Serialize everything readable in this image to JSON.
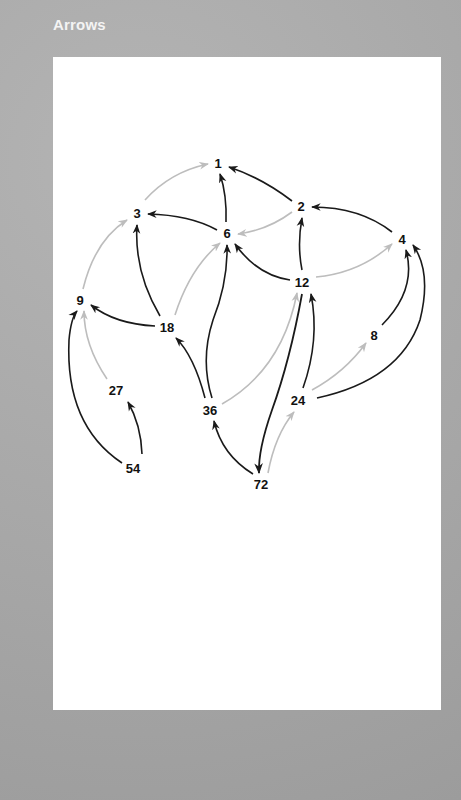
{
  "title": "Arrows",
  "colors": {
    "background": "#a8a8a8",
    "panel": "#ffffff",
    "edge_dark": "#1a1a1a",
    "edge_light": "#bdbdbd",
    "label": "#111111"
  },
  "nodes": [
    {
      "id": "1",
      "label": "1",
      "x": 218,
      "y": 163
    },
    {
      "id": "2",
      "label": "2",
      "x": 301,
      "y": 206
    },
    {
      "id": "3",
      "label": "3",
      "x": 137,
      "y": 213
    },
    {
      "id": "4",
      "label": "4",
      "x": 402,
      "y": 239
    },
    {
      "id": "6",
      "label": "6",
      "x": 227,
      "y": 233
    },
    {
      "id": "9",
      "label": "9",
      "x": 80,
      "y": 300
    },
    {
      "id": "12",
      "label": "12",
      "x": 302,
      "y": 282
    },
    {
      "id": "18",
      "label": "18",
      "x": 167,
      "y": 327
    },
    {
      "id": "8",
      "label": "8",
      "x": 374,
      "y": 335
    },
    {
      "id": "27",
      "label": "27",
      "x": 116,
      "y": 390
    },
    {
      "id": "24",
      "label": "24",
      "x": 298,
      "y": 400
    },
    {
      "id": "36",
      "label": "36",
      "x": 210,
      "y": 410
    },
    {
      "id": "54",
      "label": "54",
      "x": 133,
      "y": 468
    },
    {
      "id": "72",
      "label": "72",
      "x": 261,
      "y": 484
    }
  ],
  "edges": [
    {
      "from": "3",
      "to": "1",
      "style": "light"
    },
    {
      "from": "2",
      "to": "1",
      "style": "dark"
    },
    {
      "from": "6",
      "to": "1",
      "style": "dark"
    },
    {
      "from": "6",
      "to": "3",
      "style": "dark"
    },
    {
      "from": "2",
      "to": "6",
      "style": "light"
    },
    {
      "from": "4",
      "to": "2",
      "style": "dark"
    },
    {
      "from": "12",
      "to": "2",
      "style": "dark"
    },
    {
      "from": "12",
      "to": "4",
      "style": "light"
    },
    {
      "from": "12",
      "to": "6",
      "style": "dark"
    },
    {
      "from": "9",
      "to": "3",
      "style": "light"
    },
    {
      "from": "18",
      "to": "3",
      "style": "dark"
    },
    {
      "from": "18",
      "to": "9",
      "style": "dark"
    },
    {
      "from": "18",
      "to": "6",
      "style": "light"
    },
    {
      "from": "36",
      "to": "6",
      "style": "dark"
    },
    {
      "from": "36",
      "to": "18",
      "style": "dark"
    },
    {
      "from": "36",
      "to": "12",
      "style": "light"
    },
    {
      "from": "27",
      "to": "9",
      "style": "light"
    },
    {
      "from": "54",
      "to": "9",
      "style": "dark"
    },
    {
      "from": "54",
      "to": "27",
      "style": "dark"
    },
    {
      "from": "8",
      "to": "4",
      "style": "dark"
    },
    {
      "from": "24",
      "to": "4",
      "style": "dark"
    },
    {
      "from": "24",
      "to": "8",
      "style": "light"
    },
    {
      "from": "24",
      "to": "12",
      "style": "dark"
    },
    {
      "from": "12",
      "to": "72",
      "style": "dark"
    },
    {
      "from": "72",
      "to": "36",
      "style": "dark"
    },
    {
      "from": "72",
      "to": "24",
      "style": "light"
    }
  ]
}
